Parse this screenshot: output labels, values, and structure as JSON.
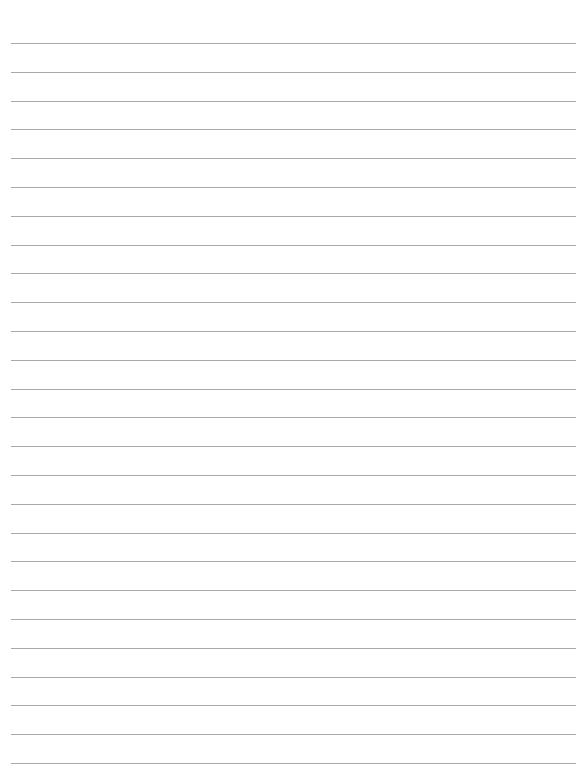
{
  "page": {
    "type": "lined-paper",
    "background": "#ffffff",
    "line_color": "#a9a9a9",
    "line_count": 26,
    "first_line_y": 43,
    "line_spacing": 28.8,
    "line_left": 11,
    "line_right": 576,
    "text": ""
  }
}
